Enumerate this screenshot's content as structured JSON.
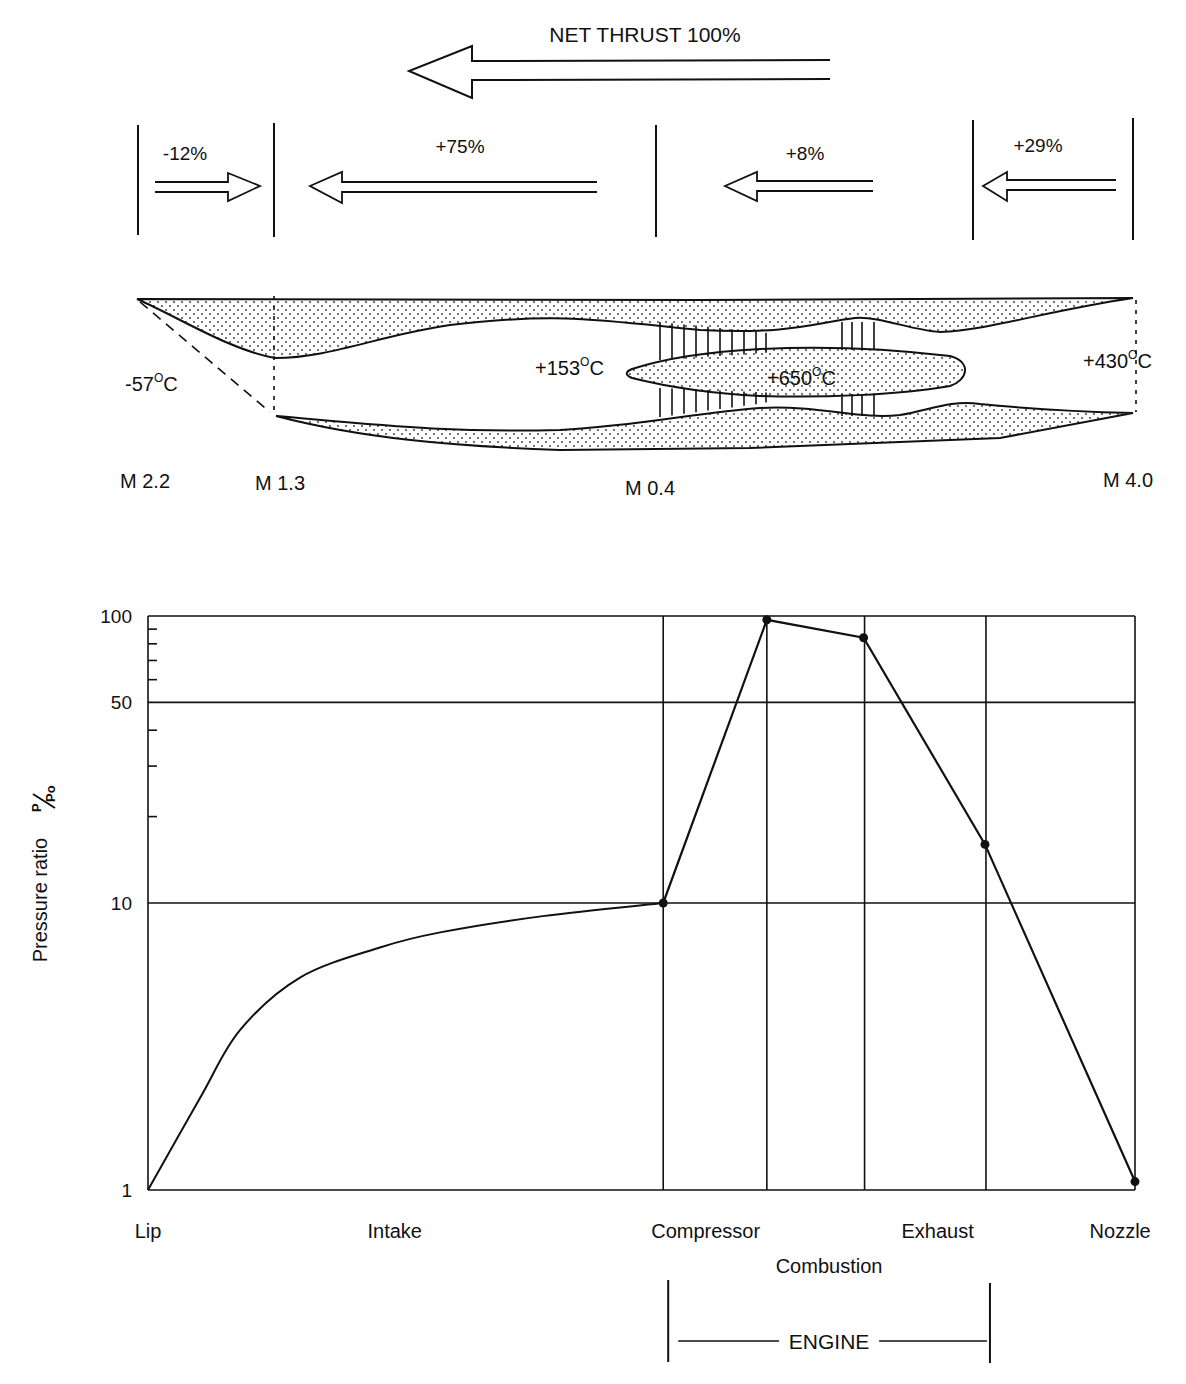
{
  "diagram": {
    "net_thrust_label": "NET THRUST 100%",
    "thrust_contributions": [
      {
        "label": "-12%",
        "direction": "rearward",
        "section": "external intake"
      },
      {
        "label": "+75%",
        "direction": "forward",
        "section": "intake"
      },
      {
        "label": "+8%",
        "direction": "forward",
        "section": "engine"
      },
      {
        "label": "+29%",
        "direction": "forward",
        "section": "nozzle"
      }
    ],
    "temperatures": [
      {
        "label": "-57",
        "unit": "C"
      },
      {
        "label": "+153",
        "unit": "C"
      },
      {
        "label": "+650",
        "unit": "C"
      },
      {
        "label": "+430",
        "unit": "C"
      }
    ],
    "mach_numbers": [
      "M 2.2",
      "M 1.3",
      "M 0.4",
      "M 4.0"
    ],
    "degree_mark": "O",
    "colors": {
      "ink": "#111111",
      "paper": "#ffffff"
    }
  },
  "chart_data": {
    "type": "line",
    "title": "",
    "ylabel": "Pressure ratio",
    "ylabel_fraction": {
      "numerator": "P",
      "denominator": "Po"
    },
    "xlabel": "",
    "yscale": "log",
    "ylim": [
      1,
      100
    ],
    "yticks": [
      {
        "value": 1,
        "label": "1"
      },
      {
        "value": 10,
        "label": "10"
      },
      {
        "value": 50,
        "label": "50"
      },
      {
        "value": 100,
        "label": "100"
      }
    ],
    "minor_yticks": [
      20,
      30,
      40,
      60,
      70,
      80,
      90
    ],
    "xlim": [
      0,
      1
    ],
    "stations": [
      {
        "name": "Lip",
        "x": 0.0
      },
      {
        "name": "Compressor start",
        "x": 0.522
      },
      {
        "name": "Compressor end",
        "x": 0.627
      },
      {
        "name": "Combustion end",
        "x": 0.726
      },
      {
        "name": "Exhaust end",
        "x": 0.849
      },
      {
        "name": "Nozzle",
        "x": 1.0
      }
    ],
    "category_labels": [
      {
        "label": "Lip",
        "x": 0.0,
        "row": 1
      },
      {
        "label": "Intake",
        "x": 0.25,
        "row": 1
      },
      {
        "label": "Compressor",
        "x": 0.565,
        "row": 1
      },
      {
        "label": "Combustion",
        "x": 0.69,
        "row": 2
      },
      {
        "label": "Exhaust",
        "x": 0.8,
        "row": 1
      },
      {
        "label": "Nozzle",
        "x": 0.985,
        "row": 1
      }
    ],
    "engine_bracket": {
      "label": "ENGINE",
      "from": 0.522,
      "to": 0.85
    },
    "series": [
      {
        "name": "Pressure ratio",
        "intake_curve": [
          {
            "x": 0.0,
            "y": 1.0
          },
          {
            "x": 0.053,
            "y": 2.1
          },
          {
            "x": 0.093,
            "y": 3.6
          },
          {
            "x": 0.154,
            "y": 5.5
          },
          {
            "x": 0.235,
            "y": 7.0
          },
          {
            "x": 0.296,
            "y": 7.9
          },
          {
            "x": 0.4,
            "y": 9.0
          },
          {
            "x": 0.522,
            "y": 10.0
          }
        ],
        "marked_points": [
          {
            "x": 0.522,
            "y": 10.0
          },
          {
            "x": 0.627,
            "y": 97
          },
          {
            "x": 0.725,
            "y": 84
          },
          {
            "x": 0.848,
            "y": 16
          },
          {
            "x": 1.0,
            "y": 1.07
          }
        ]
      }
    ],
    "grid": true,
    "legend": "none"
  }
}
